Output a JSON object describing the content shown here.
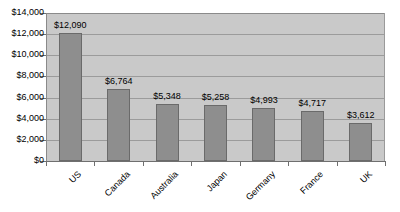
{
  "chart_data": {
    "type": "bar",
    "title": "",
    "subtitle": "",
    "xlabel": "",
    "ylabel": "",
    "categories": [
      "US",
      "Canada",
      "Australia",
      "Japan",
      "Germany",
      "France",
      "UK"
    ],
    "values": [
      12090,
      6764,
      5348,
      5258,
      4993,
      4717,
      3612
    ],
    "data_labels": [
      "$12,090",
      "$6,764",
      "$5,348",
      "$5,258",
      "$4,993",
      "$4,717",
      "$3,612"
    ],
    "series": [
      {
        "name": "",
        "values": [
          12090,
          6764,
          5348,
          5258,
          4993,
          4717,
          3612
        ]
      }
    ],
    "ylim": [
      0,
      14000
    ],
    "ytick_values": [
      0,
      2000,
      4000,
      6000,
      8000,
      10000,
      12000,
      14000
    ],
    "ytick_labels": [
      "$0",
      "$2,000",
      "$4,000",
      "$6,000",
      "$8,000",
      "$10,000",
      "$12,000",
      "$14,000"
    ],
    "grid": true,
    "grid_axis": "y",
    "legend": false,
    "legend_position": "none",
    "bar_color": "#8e8e8e",
    "bar_border_color": "#6a6a6a",
    "plot_background": "#c9c9c9",
    "gridline_color": "#9b9b9b",
    "axis_color": "#6f6f6f",
    "page_background": "#ffffff",
    "category_label_rotation": -45
  }
}
